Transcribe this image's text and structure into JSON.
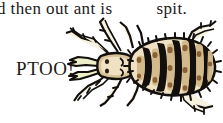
{
  "page": {
    "background_color": "#ffffff",
    "width": 223,
    "height": 123
  },
  "text": {
    "body_line": "d then out ant is",
    "body_line_gap": " ",
    "body_line_tail": "spit.",
    "sound_effect": "PTOO!",
    "text_color": "#1c1a18"
  },
  "illustration": {
    "name": "spitting-insect",
    "subject": "louse / ant-like insect, dorsal view, facing left",
    "parts": [
      "mandibles",
      "head",
      "eyes",
      "antennae",
      "thorax",
      "segmented-abdomen",
      "legs",
      "bristles"
    ],
    "colors": {
      "outline": "#120f0c",
      "body_light": "#f3e7cd",
      "body_mid": "#d9c49a",
      "body_shade": "#b08b5e",
      "spot": "#8a6134",
      "mandible": "#ecefc8",
      "leg": "#f7f2df",
      "highlight": "#fffaf0"
    },
    "segment_count": 8,
    "leg_count": 6
  }
}
